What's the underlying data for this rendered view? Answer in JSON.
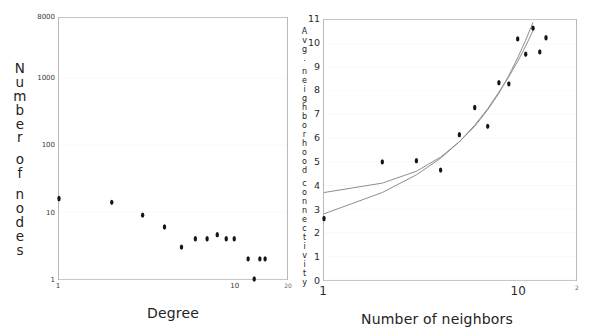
{
  "figure": {
    "background_color": "#ffffff",
    "dot_color": "#151515",
    "frame_color": "#b9b9b9",
    "fit_color_a": "#8d8d8d",
    "fit_color_b": "#a9a9a9"
  },
  "chart_data": [
    {
      "id": "degree-distribution",
      "type": "scatter",
      "title": "",
      "xlabel": "Degree",
      "ylabel": "Number of nodes",
      "xscale": "log",
      "yscale": "log",
      "xlim": [
        1,
        20
      ],
      "ylim": [
        1,
        8000
      ],
      "grid": true,
      "legend": "none",
      "xticks": [
        "1",
        "10",
        "20"
      ],
      "xtick_values": [
        1,
        10,
        20
      ],
      "yticks": [
        "1",
        "10",
        "100",
        "1000",
        "8000"
      ],
      "ytick_values": [
        1,
        10,
        100,
        1000,
        8000
      ],
      "ylabel_chars": [
        "N",
        "u",
        "m",
        "b",
        "e",
        "r",
        "",
        "o",
        "f",
        "",
        "n",
        "o",
        "d",
        "e",
        "s"
      ],
      "points": [
        {
          "x": 1,
          "y": 16
        },
        {
          "x": 2,
          "y": 14
        },
        {
          "x": 3,
          "y": 9
        },
        {
          "x": 4,
          "y": 6
        },
        {
          "x": 5,
          "y": 3
        },
        {
          "x": 6,
          "y": 4
        },
        {
          "x": 7,
          "y": 4
        },
        {
          "x": 8,
          "y": 4.6
        },
        {
          "x": 9,
          "y": 4
        },
        {
          "x": 10,
          "y": 4
        },
        {
          "x": 12,
          "y": 2
        },
        {
          "x": 13,
          "y": 1
        },
        {
          "x": 14,
          "y": 2
        },
        {
          "x": 15,
          "y": 2
        }
      ]
    },
    {
      "id": "neighborhood-connectivity",
      "type": "scatter",
      "title": "",
      "xlabel": "Number of neighbors",
      "ylabel": "Avg. neighborhood connectivity",
      "xscale": "log",
      "yscale": "linear",
      "xlim": [
        1,
        20
      ],
      "ylim": [
        0,
        11
      ],
      "grid": true,
      "legend": "none",
      "xticks": [
        "1",
        "10",
        "2"
      ],
      "xtick_values": [
        1,
        10,
        20
      ],
      "yticks": [
        "0",
        "1",
        "2",
        "3",
        "4",
        "5",
        "6",
        "7",
        "8",
        "9",
        "10",
        "11"
      ],
      "ytick_values": [
        0,
        1,
        2,
        3,
        4,
        5,
        6,
        7,
        8,
        9,
        10,
        11
      ],
      "ylabel_chars": [
        "A",
        "v",
        "g",
        ".",
        "",
        "n",
        "e",
        "i",
        "g",
        "h",
        "b",
        "o",
        "r",
        "h",
        "o",
        "o",
        "d",
        "",
        "c",
        "o",
        "n",
        "n",
        "e",
        "c",
        "t",
        "i",
        "v",
        "i",
        "t",
        "y"
      ],
      "points": [
        {
          "x": 1,
          "y": 2.6
        },
        {
          "x": 2,
          "y": 5.0
        },
        {
          "x": 3,
          "y": 5.05
        },
        {
          "x": 4,
          "y": 4.65
        },
        {
          "x": 5,
          "y": 6.15
        },
        {
          "x": 6,
          "y": 7.3
        },
        {
          "x": 7,
          "y": 6.5
        },
        {
          "x": 8,
          "y": 8.35
        },
        {
          "x": 9,
          "y": 8.3
        },
        {
          "x": 10,
          "y": 10.2
        },
        {
          "x": 11,
          "y": 9.55
        },
        {
          "x": 12,
          "y": 10.65
        },
        {
          "x": 13,
          "y": 9.65
        },
        {
          "x": 14,
          "y": 10.25
        }
      ],
      "fits": [
        {
          "name": "power-law-fit-a",
          "color": "#8d8d8d",
          "points": [
            {
              "x": 1,
              "y": 3.7
            },
            {
              "x": 2,
              "y": 4.1
            },
            {
              "x": 3,
              "y": 4.6
            },
            {
              "x": 4,
              "y": 5.2
            },
            {
              "x": 5,
              "y": 5.85
            },
            {
              "x": 6,
              "y": 6.5
            },
            {
              "x": 7,
              "y": 7.2
            },
            {
              "x": 8,
              "y": 7.9
            },
            {
              "x": 9,
              "y": 8.65
            },
            {
              "x": 10,
              "y": 9.4
            },
            {
              "x": 11,
              "y": 10.15
            },
            {
              "x": 12,
              "y": 10.9
            }
          ]
        },
        {
          "name": "power-law-fit-b",
          "color": "#a9a9a9",
          "points": [
            {
              "x": 1,
              "y": 2.8
            },
            {
              "x": 2,
              "y": 3.7
            },
            {
              "x": 3,
              "y": 4.45
            },
            {
              "x": 4,
              "y": 5.15
            },
            {
              "x": 5,
              "y": 5.85
            },
            {
              "x": 6,
              "y": 6.55
            },
            {
              "x": 7,
              "y": 7.25
            },
            {
              "x": 8,
              "y": 7.95
            },
            {
              "x": 9,
              "y": 8.6
            },
            {
              "x": 10,
              "y": 9.25
            },
            {
              "x": 11,
              "y": 9.9
            },
            {
              "x": 12,
              "y": 10.55
            }
          ]
        }
      ]
    }
  ]
}
